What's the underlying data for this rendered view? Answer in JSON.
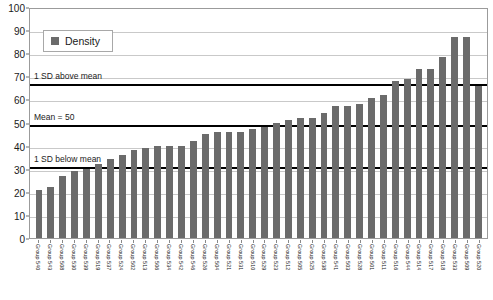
{
  "chart_data": {
    "type": "bar",
    "title": "",
    "xlabel": "",
    "ylabel": "",
    "ylim": [
      0,
      100
    ],
    "yticks": [
      0,
      10,
      20,
      30,
      40,
      50,
      60,
      70,
      80,
      90,
      100
    ],
    "grid": true,
    "legend_position": "top-left",
    "legend": [
      "Density"
    ],
    "series_name": "Density",
    "bar_color": "#6b6b6b",
    "categories": [
      "Group 540",
      "Group 543",
      "Group 508",
      "Group 530",
      "Group 539",
      "Group 519",
      "Group 537",
      "Group 524",
      "Group 502",
      "Group 513",
      "Group 506",
      "Group 534",
      "Group 542",
      "Group 546",
      "Group 526",
      "Group 504",
      "Group 521",
      "Group 531",
      "Group 510",
      "Group 529",
      "Group 523",
      "Group 512",
      "Group 505",
      "Group 525",
      "Group 538",
      "Group 541",
      "Group 503",
      "Group 528",
      "Group 501",
      "Group 511",
      "Group 516",
      "Group 544",
      "Group 514",
      "Group 517",
      "Group 518",
      "Group 533",
      "Group 509",
      "Group 520"
    ],
    "values": [
      21,
      22,
      27,
      29,
      30,
      32,
      34,
      36,
      38,
      39,
      40,
      40,
      40,
      42,
      45,
      46,
      46,
      46,
      47,
      48,
      50,
      51,
      52,
      52,
      54,
      57,
      57,
      58,
      60.5,
      62,
      68,
      69,
      73,
      73,
      78.5,
      87,
      87,
      66
    ],
    "reference_lines": [
      {
        "label": "1 SD above mean",
        "value": 67.5
      },
      {
        "label": "Mean = 50",
        "value": 50
      },
      {
        "label": "1 SD below mean",
        "value": 31.5
      }
    ]
  }
}
